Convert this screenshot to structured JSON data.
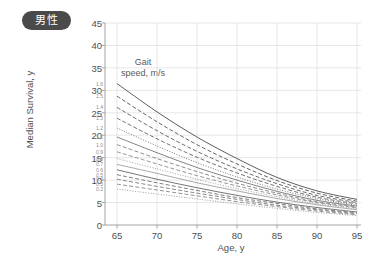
{
  "badge": {
    "label": "男性"
  },
  "chart_data": {
    "type": "line",
    "title": "",
    "subtitle": "",
    "xlabel": "Age, y",
    "ylabel": "Median Survival, y",
    "legend_title_line1": "Gait",
    "legend_title_line2": "speed, m/s",
    "legend_position": "inside-upper-left",
    "grid": true,
    "xlim": [
      63.5,
      95.5
    ],
    "ylim": [
      0,
      45
    ],
    "xticks": [
      65,
      70,
      75,
      80,
      85,
      90,
      95
    ],
    "yticks": [
      0,
      5,
      10,
      15,
      20,
      25,
      30,
      35,
      40,
      45
    ],
    "x": [
      65,
      70,
      75,
      80,
      85,
      90,
      95
    ],
    "series": [
      {
        "name": "1.6",
        "style": "solid",
        "color": "#555555",
        "values": [
          31.5,
          25.2,
          19.6,
          14.8,
          10.6,
          7.6,
          5.7
        ]
      },
      {
        "name": "1.5",
        "style": "dashed",
        "color": "#5c5c5c",
        "values": [
          28.7,
          23.0,
          17.9,
          13.6,
          9.9,
          7.1,
          5.3
        ]
      },
      {
        "name": "1.4",
        "style": "dashed",
        "color": "#636363",
        "values": [
          26.2,
          21.0,
          16.4,
          12.5,
          9.2,
          6.6,
          5.0
        ]
      },
      {
        "name": "1.3",
        "style": "dashed",
        "color": "#6a6a6a",
        "values": [
          23.8,
          19.2,
          15.1,
          11.6,
          8.6,
          6.2,
          4.7
        ]
      },
      {
        "name": "1.2",
        "style": "dotted",
        "color": "#737373",
        "values": [
          21.6,
          17.6,
          13.9,
          10.7,
          8.0,
          5.9,
          4.4
        ]
      },
      {
        "name": "1.1",
        "style": "solid",
        "color": "#7d7d7d",
        "values": [
          19.6,
          16.1,
          12.8,
          10.0,
          7.5,
          5.5,
          4.2
        ]
      },
      {
        "name": "1.0",
        "style": "dashed",
        "color": "#878787",
        "values": [
          17.9,
          14.8,
          11.9,
          9.3,
          7.1,
          5.2,
          4.0
        ]
      },
      {
        "name": "0.9",
        "style": "dashed",
        "color": "#919191",
        "values": [
          16.3,
          13.6,
          11.0,
          8.7,
          6.7,
          5.0,
          3.8
        ]
      },
      {
        "name": "0.8",
        "style": "dotted",
        "color": "#9b9b9b",
        "values": [
          14.8,
          12.5,
          10.2,
          8.1,
          6.3,
          4.7,
          3.6
        ]
      },
      {
        "name": "0.7",
        "style": "solid",
        "color": "#a5a5a5",
        "values": [
          13.5,
          11.5,
          9.4,
          7.6,
          5.9,
          4.5,
          3.4
        ]
      },
      {
        "name": "0.6",
        "style": "solid",
        "color": "#6e6e6e",
        "values": [
          12.3,
          10.2,
          8.3,
          6.6,
          5.1,
          3.9,
          2.9
        ]
      },
      {
        "name": "0.5",
        "style": "dashed",
        "color": "#787878",
        "values": [
          11.2,
          9.4,
          7.7,
          6.1,
          4.8,
          3.6,
          2.7
        ]
      },
      {
        "name": "0.4",
        "style": "dashed",
        "color": "#828282",
        "values": [
          10.2,
          8.6,
          7.1,
          5.7,
          4.4,
          3.4,
          2.5
        ]
      },
      {
        "name": "0.3",
        "style": "dashed",
        "color": "#8c8c8c",
        "values": [
          9.1,
          7.8,
          6.5,
          5.2,
          4.1,
          3.1,
          2.3
        ]
      },
      {
        "name": "0.2",
        "style": "dotted",
        "color": "#999999",
        "values": [
          8.0,
          6.9,
          5.8,
          4.7,
          3.7,
          2.8,
          2.1
        ]
      }
    ]
  }
}
